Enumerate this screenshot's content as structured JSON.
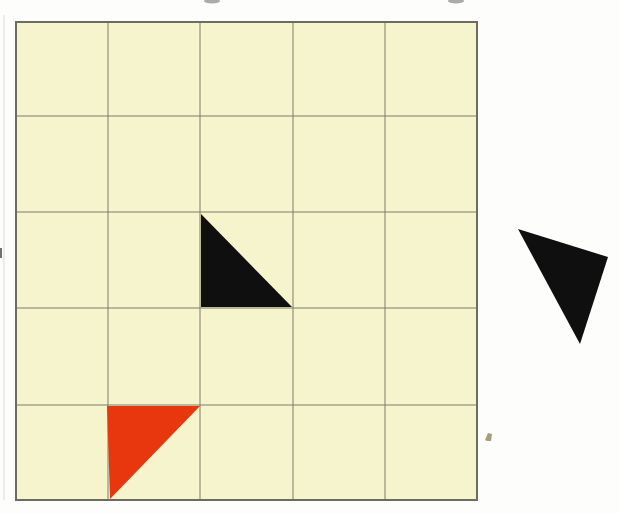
{
  "colors": {
    "page_bg": "#fdfdfb",
    "cell_fill": "#f6f4cc",
    "grid_line": "#7c7c6e",
    "grid_border": "#6c6c60",
    "shape_black": "#0f0f0f",
    "shape_red": "#e8370e",
    "speck_tan": "#a79d7b",
    "smudge_gray": "#8f8f8f",
    "scan_edge": "#dddcd4",
    "edge_dash": "#6f6f6f"
  },
  "grid": {
    "x": 16,
    "y": 22,
    "width": 461,
    "height": 478,
    "right": 477,
    "bottom": 500,
    "columns": 5,
    "rows": 5,
    "border_width": 2,
    "v_lines": [
      108,
      200,
      293,
      385
    ],
    "h_lines": [
      116,
      212,
      308,
      405
    ]
  },
  "shapes": {
    "black_triangle_in_grid": {
      "points": "201,214 201,307 292,307",
      "cell": "row 3, column 3",
      "orientation": "right angle at bottom-left"
    },
    "red_triangle_in_grid": {
      "points": "107,406 200,406 110,499",
      "cell": "row 5, column 2",
      "orientation": "right angle at top-left"
    },
    "loose_black_triangle": {
      "points": "518,229 608,257 580,344",
      "position": "outside grid, right side",
      "orientation": "rotated right triangle, right angle at right vertex"
    }
  },
  "artifacts": {
    "scan_edge_line": {
      "x": 4,
      "y1": 15,
      "y2": 500
    },
    "left_edge_dash": {
      "x": 0,
      "y": 248,
      "width": 2,
      "height": 10
    },
    "smudge_left": {
      "cx": 212,
      "cy": 1,
      "rx": 8,
      "ry": 2.5
    },
    "smudge_right": {
      "cx": 456,
      "cy": 1,
      "rx": 8,
      "ry": 2.5
    },
    "dust_speck": {
      "points": "485,440 488,433 492,434 491,441 487,441"
    }
  }
}
